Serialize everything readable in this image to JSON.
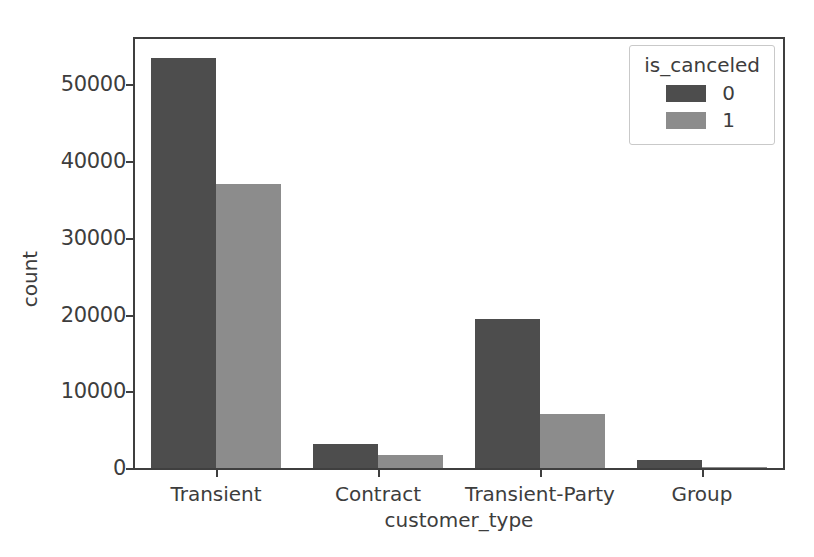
{
  "chart_data": {
    "type": "bar",
    "title": "",
    "xlabel": "customer_type",
    "ylabel": "count",
    "categories": [
      "Transient",
      "Contract",
      "Transient-Party",
      "Group"
    ],
    "series": [
      {
        "name": "0",
        "color": "#4d4d4d",
        "values": [
          53400,
          3100,
          19400,
          1100
        ]
      },
      {
        "name": "1",
        "color": "#8c8c8c",
        "values": [
          36950,
          1700,
          7000,
          150
        ]
      }
    ],
    "legend": {
      "title": "is_canceled",
      "position": "upper right",
      "entries": [
        "0",
        "1"
      ]
    },
    "yticks": [
      0,
      10000,
      20000,
      30000,
      40000,
      50000
    ],
    "yticklabels": [
      "0",
      "10000",
      "20000",
      "30000",
      "40000",
      "50000"
    ],
    "ylim": [
      0,
      55900
    ],
    "grid": false,
    "frame": true
  },
  "colors": {
    "axis": "#3f3f3f",
    "text": "#3d3d3d",
    "background": "#ffffff",
    "legend_border": "#c9c9c9"
  }
}
